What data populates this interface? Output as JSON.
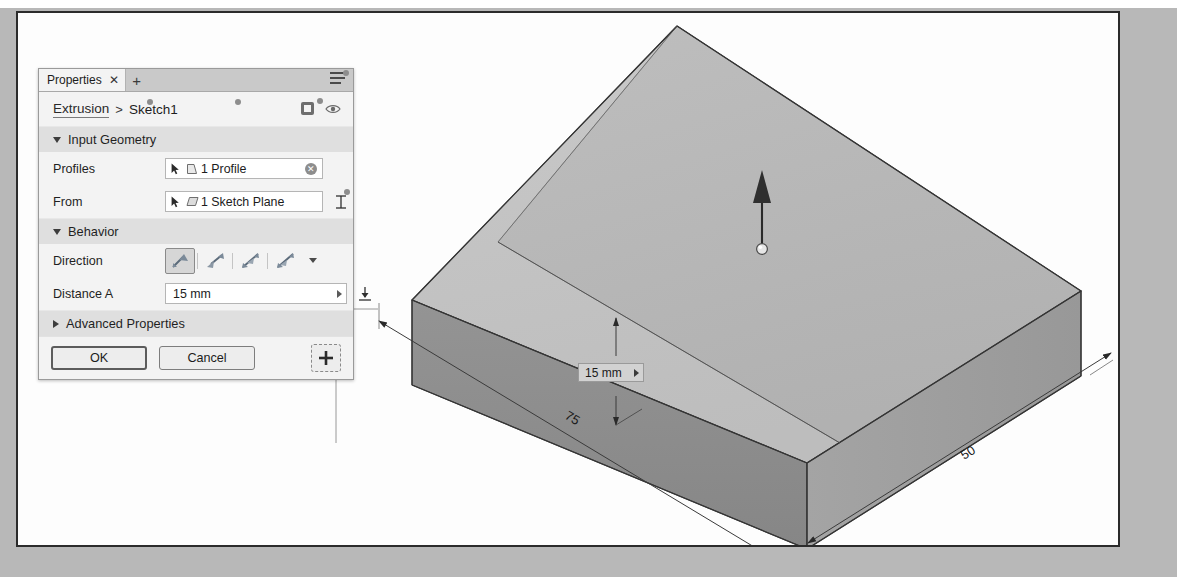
{
  "app": {
    "panel_title": "Properties",
    "tab_close_label": "✕",
    "tab_add_label": "+",
    "menu_icon": "hamburger-menu-icon"
  },
  "breadcrumb": {
    "parent": "Extrusion",
    "separator": ">",
    "current": "Sketch1",
    "solid_icon": "new-solid-body-icon",
    "visibility_icon": "eye-visibility-icon"
  },
  "sections": {
    "input_geometry": {
      "title": "Input Geometry",
      "expanded": true,
      "rows": [
        {
          "label": "Profiles",
          "value": "1 Profile",
          "select_icon": "cursor-arrow-icon",
          "type_icon": "profile-face-icon",
          "clear_label": "✕"
        },
        {
          "label": "From",
          "value": "1 Sketch Plane",
          "select_icon": "cursor-arrow-icon",
          "type_icon": "sketch-plane-icon",
          "tool_icon": "offset-start-icon"
        }
      ]
    },
    "behavior": {
      "title": "Behavior",
      "expanded": true,
      "direction": {
        "label": "Direction",
        "options": [
          "direction-one-side-icon",
          "direction-flipped-icon",
          "direction-symmetric-icon",
          "direction-asymmetric-icon"
        ],
        "selected_index": 0,
        "more_icon": "chevron-down-icon"
      },
      "distance": {
        "label": "Distance A",
        "value": "15 mm",
        "placeholder": "0 mm",
        "expand_icon": "chevron-right-icon",
        "tool_icon": "measure-to-icon"
      }
    },
    "advanced": {
      "title": "Advanced Properties",
      "expanded": false
    }
  },
  "footer": {
    "ok_label": "OK",
    "cancel_label": "Cancel",
    "add_label": "+",
    "add_icon": "plus-icon"
  },
  "canvas": {
    "inline_distance": {
      "value": "15 mm",
      "expand_icon": "chevron-right-icon"
    },
    "manipulator": {
      "name": "extrude-direction-arrow",
      "handle": "drag-sphere-handle"
    },
    "dimensions": [
      {
        "name": "length-dimension",
        "value": "75"
      },
      {
        "name": "width-dimension",
        "value": "50"
      }
    ],
    "model": {
      "name": "extruded-box-solid",
      "top_face_color": "#c2c2c2",
      "preview_face_color": "#b0b0b0",
      "front_face_color": "#8d8d8d",
      "side_face_color": "#9c9c9c",
      "edge_color": "#3a3a3a"
    }
  }
}
